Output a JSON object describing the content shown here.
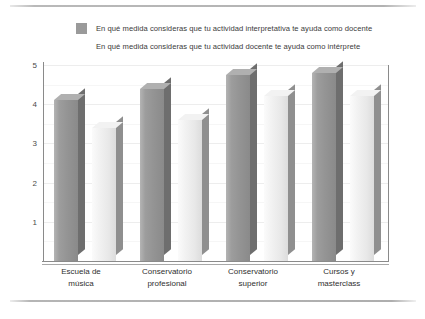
{
  "legend": {
    "entries": [
      {
        "label": "En qué medida consideras que tu actividad interpretativa te ayuda como docente",
        "swatch": "#9a9a9a",
        "name": "legend-swatch-series-1"
      },
      {
        "label": "En qué medida consideras que tu actividad docente te ayuda como intérprete",
        "swatch": "#ffffff",
        "name": "legend-swatch-series-2"
      }
    ]
  },
  "axis": {
    "y_ticks": [
      "1",
      "2",
      "3",
      "4",
      "5"
    ]
  },
  "chart_data": {
    "type": "bar",
    "title": "",
    "xlabel": "",
    "ylabel": "",
    "ylim": [
      0,
      5
    ],
    "yticks": [
      1,
      2,
      3,
      4,
      5
    ],
    "grid": true,
    "legend_position": "top",
    "categories": [
      "Escuela de música",
      "Conservatorio profesional",
      "Conservatorio superior",
      "Cursos y masterclass"
    ],
    "category_lines": [
      [
        "Escuela de",
        "música"
      ],
      [
        "Conservatorio",
        "profesional"
      ],
      [
        "Conservatorio",
        "superior"
      ],
      [
        "Cursos y",
        "masterclass"
      ]
    ],
    "series": [
      {
        "name": "En qué medida consideras que tu actividad interpretativa te ayuda como docente",
        "color": "#9a9a9a",
        "values": [
          4.1,
          4.4,
          4.75,
          4.8
        ]
      },
      {
        "name": "En qué medida consideras que tu actividad docente te ayuda como intérprete",
        "color": "#f2f2f2",
        "values": [
          3.4,
          3.6,
          4.2,
          4.2
        ]
      }
    ]
  }
}
